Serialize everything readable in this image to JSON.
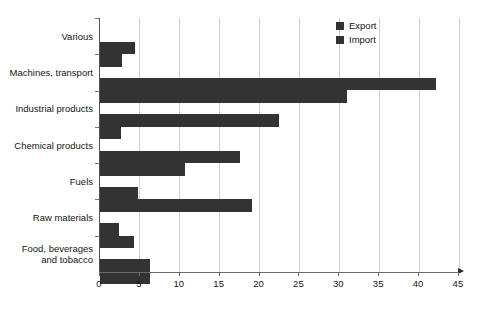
{
  "chart_data": {
    "type": "bar",
    "orientation": "horizontal",
    "title": "",
    "xlabel": "",
    "ylabel": "",
    "xlim": [
      0,
      45
    ],
    "xticks": [
      0,
      5,
      10,
      15,
      20,
      25,
      30,
      35,
      40,
      45
    ],
    "grid": "vertical",
    "legend_position": "top-right",
    "categories": [
      "Various",
      "Machines, transport",
      "Industrial products",
      "Chemical products",
      "Fuels",
      "Raw materials",
      "Food, beverages\nand tobacco"
    ],
    "series": [
      {
        "name": "Export",
        "color": "#333333",
        "values": [
          4.4,
          42.1,
          22.4,
          17.6,
          4.8,
          2.4,
          6.3
        ]
      },
      {
        "name": "Import",
        "color": "#333333",
        "values": [
          2.7,
          31.0,
          2.6,
          10.7,
          19.0,
          4.2,
          6.3
        ]
      }
    ]
  },
  "legend": {
    "items": [
      {
        "label": "Export",
        "color": "#333333"
      },
      {
        "label": "Import",
        "color": "#333333"
      }
    ]
  },
  "axis": {
    "x_tick_labels": [
      "0",
      "5",
      "10",
      "15",
      "20",
      "25",
      "30",
      "35",
      "40",
      "45"
    ]
  }
}
